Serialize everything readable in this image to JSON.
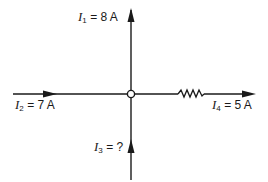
{
  "diagram": {
    "title": "",
    "node": {
      "label": "junction",
      "x": 131,
      "y": 94
    },
    "currents": [
      {
        "id": "I1",
        "symbol": "I",
        "subscript": "1",
        "value": "= 8 A",
        "direction": "outward-up"
      },
      {
        "id": "I2",
        "symbol": "I",
        "subscript": "2",
        "value": "= 7 A",
        "direction": "inward-from-left"
      },
      {
        "id": "I3",
        "symbol": "I",
        "subscript": "3",
        "value": "= ?",
        "direction": "inward-from-bottom"
      },
      {
        "id": "I4",
        "symbol": "I",
        "subscript": "4",
        "value": "= 5 A",
        "direction": "outward-right"
      }
    ],
    "components": [
      {
        "type": "resistor",
        "branch": "I4"
      }
    ],
    "colors": {
      "line": "#1a1a1a",
      "background": "#ffffff"
    }
  }
}
